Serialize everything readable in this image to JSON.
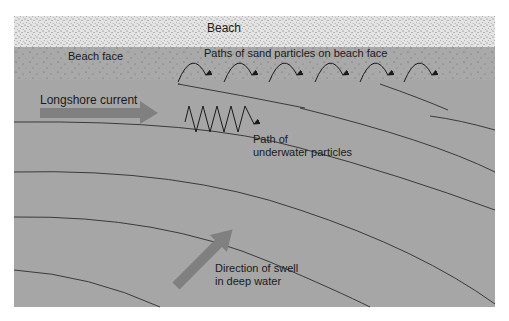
{
  "labels": {
    "beach": "Beach",
    "beach_face": "Beach face",
    "sand_paths": "Paths of sand particles on beach face",
    "longshore_current": "Longshore current",
    "underwater_path_line1": "Path of",
    "underwater_path_line2": "underwater particles",
    "swell_line1": "Direction of swell",
    "swell_line2": "in deep water"
  },
  "colors": {
    "beach": "#e2e2e2",
    "beach_face": "#a9a9a9",
    "water": "#a6a6a6",
    "arrow": "#808080",
    "line": "#3a3a3a"
  }
}
